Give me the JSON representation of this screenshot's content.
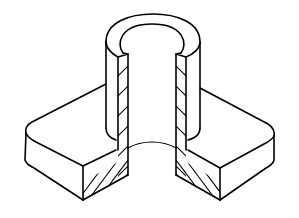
{
  "figure": {
    "colors": {
      "line": "#000000",
      "background": "#ffffff"
    },
    "hatching": {
      "left_section_direction": "ascending",
      "right_section_direction": "descending"
    }
  }
}
